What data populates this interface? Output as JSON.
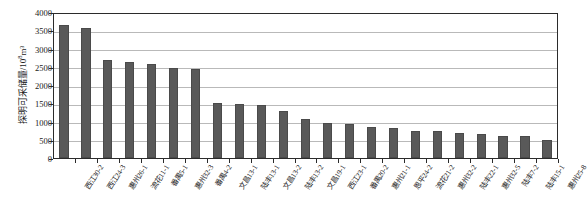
{
  "chart_data": {
    "type": "bar",
    "title": "",
    "xlabel": "",
    "ylabel": "探明可采储量/10⁸m³",
    "ylabel_text": "探明可采储量/10",
    "ylabel_exponent": "8",
    "ylabel_unit": "m³",
    "ylim": [
      0,
      4000
    ],
    "ytick_values": [
      0,
      500,
      1000,
      1500,
      2000,
      2500,
      3000,
      3500,
      4000
    ],
    "ytick_labels": [
      "0",
      "500",
      "1000",
      "1500",
      "2000",
      "2500",
      "3000",
      "3500",
      "4000"
    ],
    "grid": true,
    "legend": "none",
    "bar_color": "#595959",
    "categories": [
      "西江30-2",
      "西江24-3",
      "惠州26-1",
      "流花11-1",
      "番禺5-1",
      "惠州32-3",
      "番禺4-2",
      "文昌13-1",
      "陆丰13-1",
      "文昌13-2",
      "陆丰13-2",
      "文昌19-1",
      "西江23-1",
      "番禺20-2",
      "惠州21-1",
      "恩平24-2",
      "流花21-2",
      "惠州32-2",
      "陆丰22-1",
      "惠州32-5",
      "陆丰7-2",
      "陆丰15-1",
      "惠州25-8"
    ],
    "values": [
      3700,
      3620,
      2720,
      2660,
      2600,
      2500,
      2480,
      1520,
      1490,
      1470,
      1300,
      1080,
      960,
      950,
      870,
      840,
      760,
      740,
      690,
      660,
      620,
      600,
      500
    ]
  },
  "caption": {
    "text": ""
  }
}
